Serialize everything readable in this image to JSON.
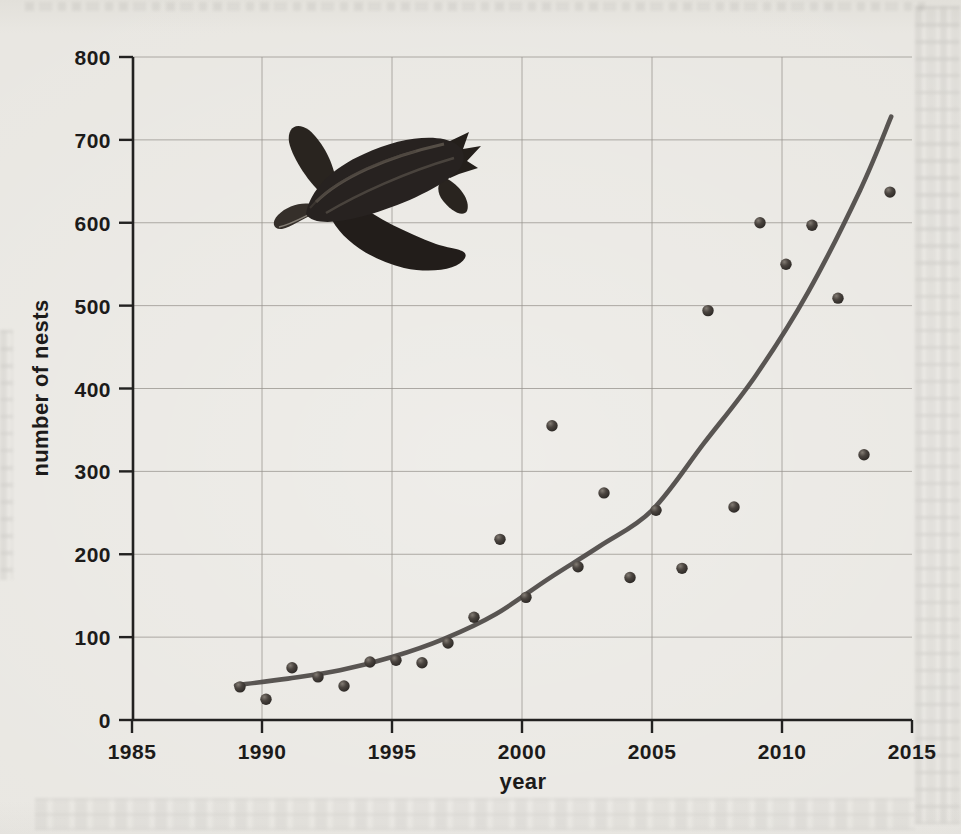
{
  "page": {
    "kind": "scanned textbook figure",
    "background_color": "#e9e7e2"
  },
  "chart_data": {
    "type": "scatter",
    "title": "",
    "xlabel": "year",
    "ylabel": "number of nests",
    "xlim": [
      1985,
      2015
    ],
    "ylim": [
      0,
      800
    ],
    "x_ticks": [
      1985,
      1990,
      1995,
      2000,
      2005,
      2010,
      2015
    ],
    "y_ticks": [
      0,
      100,
      200,
      300,
      400,
      500,
      600,
      700,
      800
    ],
    "grid": true,
    "legend_position": "none",
    "illustration": "leatherback-sea-turtle",
    "colors": {
      "point": "#3e3a36",
      "point_highlight": "#837c74",
      "trend_curve": "#4c4845",
      "axis": "#222120",
      "gridline": "#96928c",
      "labels": "#1c1b1a"
    },
    "series": [
      {
        "name": "number of nests per year",
        "type": "scatter",
        "points": [
          [
            1989,
            40
          ],
          [
            1990,
            25
          ],
          [
            1991,
            63
          ],
          [
            1992,
            52
          ],
          [
            1993,
            41
          ],
          [
            1994,
            70
          ],
          [
            1995,
            72
          ],
          [
            1996,
            69
          ],
          [
            1997,
            93
          ],
          [
            1998,
            124
          ],
          [
            1999,
            218
          ],
          [
            2000,
            148
          ],
          [
            2001,
            355
          ],
          [
            2002,
            185
          ],
          [
            2003,
            274
          ],
          [
            2004,
            172
          ],
          [
            2005,
            253
          ],
          [
            2006,
            183
          ],
          [
            2007,
            494
          ],
          [
            2008,
            257
          ],
          [
            2009,
            600
          ],
          [
            2010,
            550
          ],
          [
            2011,
            597
          ],
          [
            2012,
            509
          ],
          [
            2013,
            320
          ],
          [
            2014,
            637
          ]
        ]
      },
      {
        "name": "exponential trend curve",
        "type": "line",
        "points": [
          [
            1989,
            42
          ],
          [
            1991,
            50
          ],
          [
            1993,
            60
          ],
          [
            1995,
            76
          ],
          [
            1997,
            98
          ],
          [
            1999,
            128
          ],
          [
            2001,
            170
          ],
          [
            2003,
            210
          ],
          [
            2005,
            253
          ],
          [
            2007,
            334
          ],
          [
            2009,
            416
          ],
          [
            2011,
            516
          ],
          [
            2013,
            639
          ],
          [
            2014.2,
            728
          ]
        ]
      }
    ]
  }
}
